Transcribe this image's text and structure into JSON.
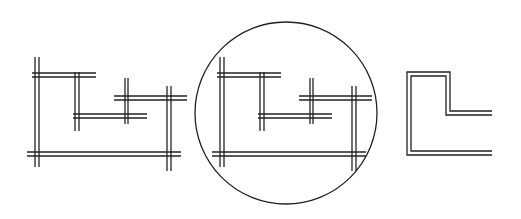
{
  "diagram": {
    "stroke_color": "#222222",
    "background": "#ffffff",
    "figures": [
      {
        "name": "crossing-double-lines",
        "offset_x": 0
      },
      {
        "name": "circled-crossing-double-lines",
        "offset_x": 185,
        "circle": {
          "cx": 286,
          "cy": 113,
          "r": 91
        }
      },
      {
        "name": "l-shape-outline"
      }
    ]
  }
}
